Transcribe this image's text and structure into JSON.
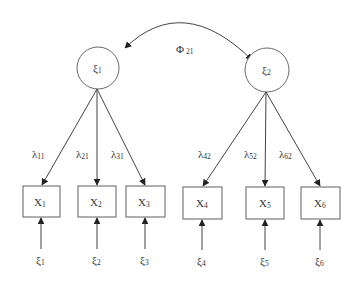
{
  "diagram": {
    "type": "structural-equation-model",
    "colors": {
      "stroke": "#444444",
      "box_border": "#7a7a7a",
      "text": "#333333",
      "background": "#ffffff"
    },
    "covariance": {
      "symbol": "Φ",
      "subscript": "21",
      "from": "xi1",
      "to": "xi2"
    },
    "latent_factors": [
      {
        "id": "xi1",
        "symbol": "ξ",
        "subscript": "1"
      },
      {
        "id": "xi2",
        "symbol": "ξ",
        "subscript": "2"
      }
    ],
    "indicators": [
      {
        "id": "x1",
        "symbol": "X",
        "subscript": "1",
        "factor": "xi1",
        "loading": {
          "symbol": "λ",
          "subscript": "11"
        },
        "error": {
          "symbol": "ξ",
          "subscript": "1"
        }
      },
      {
        "id": "x2",
        "symbol": "X",
        "subscript": "2",
        "factor": "xi1",
        "loading": {
          "symbol": "λ",
          "subscript": "21"
        },
        "error": {
          "symbol": "ξ",
          "subscript": "2"
        }
      },
      {
        "id": "x3",
        "symbol": "X",
        "subscript": "3",
        "factor": "xi1",
        "loading": {
          "symbol": "λ",
          "subscript": "31"
        },
        "error": {
          "symbol": "ξ",
          "subscript": "3"
        }
      },
      {
        "id": "x4",
        "symbol": "X",
        "subscript": "4",
        "factor": "xi2",
        "loading": {
          "symbol": "λ",
          "subscript": "42"
        },
        "error": {
          "symbol": "ξ",
          "subscript": "4"
        }
      },
      {
        "id": "x5",
        "symbol": "X",
        "subscript": "5",
        "factor": "xi2",
        "loading": {
          "symbol": "λ",
          "subscript": "52"
        },
        "error": {
          "symbol": "ξ",
          "subscript": "5"
        }
      },
      {
        "id": "x6",
        "symbol": "X",
        "subscript": "6",
        "factor": "xi2",
        "loading": {
          "symbol": "λ",
          "subscript": "62"
        },
        "error": {
          "symbol": "ξ",
          "subscript": "6"
        }
      }
    ]
  }
}
